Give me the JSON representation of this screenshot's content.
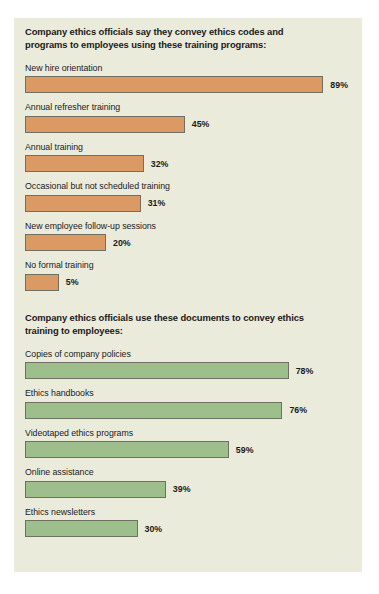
{
  "chart_data": {
    "type": "bar",
    "orientation": "horizontal",
    "title": "",
    "xlabel": "",
    "ylabel": "",
    "grid": false,
    "legend": "none",
    "value_suffix": "%",
    "xlim": [
      0,
      100
    ],
    "panels": [
      {
        "heading": "Company ethics officials say they convey ethics codes and programs to employees using these training programs:",
        "color": "#db9a64",
        "categories": [
          "New hire orientation",
          "Annual refresher training",
          "Annual training",
          "Occasional but not scheduled training",
          "New employee follow-up sessions",
          "No formal training"
        ],
        "values": [
          89,
          45,
          32,
          31,
          20,
          5
        ],
        "value_labels": [
          "89%",
          "45%",
          "32%",
          "31%",
          "20%",
          "5%"
        ]
      },
      {
        "heading": "Company ethics officials use these documents to convey ethics training to employees:",
        "color": "#9cbf8c",
        "categories": [
          "Copies of company policies",
          "Ethics handbooks",
          "Videotaped ethics programs",
          "Online assistance",
          "Ethics newsletters"
        ],
        "values": [
          78,
          76,
          59,
          39,
          30
        ],
        "value_labels": [
          "78%",
          "76%",
          "59%",
          "39%",
          "30%"
        ]
      }
    ]
  },
  "style": {
    "panel_background": "#ebebdc",
    "page_background": "#ffffff",
    "bar_border": "#6f6f63",
    "text_color": "#1a1a1a"
  }
}
